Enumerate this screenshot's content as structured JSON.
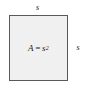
{
  "figure": {
    "type": "geometry-diagram",
    "shape": "square",
    "background_color": "#ffffff",
    "square": {
      "fill_color": "#f0f0f0",
      "border_color": "#5a5a5a",
      "area_formula": {
        "variable": "A",
        "operator": "=",
        "base": "s",
        "exponent": "2"
      }
    },
    "labels": {
      "top_side": "s",
      "right_side": "s"
    }
  }
}
